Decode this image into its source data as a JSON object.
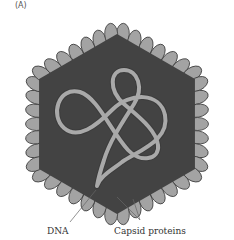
{
  "figure": {
    "panel_label": "(A)",
    "colors": {
      "capsid_body": "#434343",
      "capsid_protein_fill": "#a3a3a3",
      "capsid_protein_stroke": "#3a3a3a",
      "dna_fill": "#a9a9a9",
      "dna_stroke": "#3c3c3c",
      "leader_line": "#666666",
      "background": "#ffffff"
    },
    "labels": [
      {
        "id": "dna",
        "text": "DNA"
      },
      {
        "id": "capsid",
        "text": "Capsid proteins"
      }
    ]
  }
}
